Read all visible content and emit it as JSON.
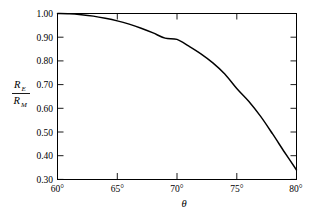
{
  "chart_data": {
    "type": "line",
    "title": "",
    "subtitle": "",
    "xlabel": "θ",
    "ylabel_numerator": "R",
    "ylabel_numerator_sub": "E",
    "ylabel_denominator": "R",
    "ylabel_denominator_sub": "M",
    "ylabel_plain": "R_E / R_M",
    "xlim": [
      60,
      80
    ],
    "ylim": [
      0.3,
      1.0
    ],
    "grid": false,
    "legend": null,
    "x_tick_labels": [
      "60°",
      "65°",
      "70°",
      "75°",
      "80°"
    ],
    "x_tick_values": [
      60,
      65,
      70,
      75,
      80
    ],
    "y_tick_labels": [
      "1.00",
      "0.90",
      "0.80",
      "0.70",
      "0.60",
      "0.50",
      "0.40",
      "0.30"
    ],
    "y_tick_values": [
      1.0,
      0.9,
      0.8,
      0.7,
      0.6,
      0.5,
      0.4,
      0.3
    ],
    "series": [
      {
        "name": "R_E/R_M",
        "color": "#000000",
        "x": [
          60,
          61,
          62,
          63,
          64,
          65,
          66,
          67,
          68,
          69,
          70,
          71,
          72,
          73,
          74,
          75,
          76,
          77,
          78,
          79,
          80
        ],
        "values": [
          1.0,
          0.999,
          0.995,
          0.989,
          0.98,
          0.969,
          0.955,
          0.938,
          0.918,
          0.896,
          0.891,
          0.862,
          0.83,
          0.792,
          0.745,
          0.684,
          0.63,
          0.566,
          0.492,
          0.415,
          0.34
        ]
      }
    ],
    "annotations": []
  },
  "axes": {
    "degree_symbol": "°",
    "theta_symbol": "θ"
  },
  "colors": {
    "background": "#ffffff",
    "ink": "#000000",
    "curve": "#000000"
  }
}
